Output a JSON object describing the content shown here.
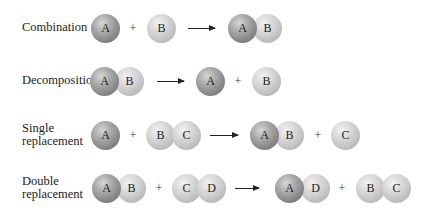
{
  "rows": [
    {
      "label": "Combination",
      "plus": "+",
      "reactants": [
        [
          "A"
        ],
        [
          "B"
        ]
      ],
      "products": [
        [
          "A",
          "B"
        ]
      ]
    },
    {
      "label": "Decomposition",
      "plus": "+",
      "reactants": [
        [
          "A",
          "B"
        ]
      ],
      "products": [
        [
          "A"
        ],
        [
          "B"
        ]
      ]
    },
    {
      "label_line1": "Single",
      "label_line2": "replacement",
      "plus": "+",
      "reactants": [
        [
          "A"
        ],
        [
          "B",
          "C"
        ]
      ],
      "products": [
        [
          "A",
          "B"
        ],
        [
          "C"
        ]
      ]
    },
    {
      "label_line1": "Double",
      "label_line2": "replacement",
      "plus": "+",
      "reactants": [
        [
          "A",
          "B"
        ],
        [
          "C",
          "D"
        ]
      ],
      "products": [
        [
          "A",
          "D"
        ],
        [
          "B",
          "C"
        ]
      ]
    }
  ],
  "colors": {
    "atom_A": "#8a8a8a",
    "atom_other": "#c8c8c8",
    "arrow": "#222222"
  }
}
